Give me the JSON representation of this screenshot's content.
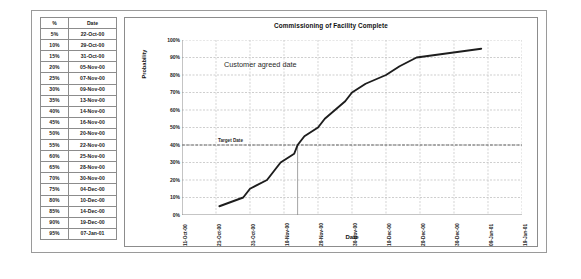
{
  "table": {
    "headers": [
      "%",
      "Date"
    ],
    "rows": [
      [
        "5%",
        "22-Oct-00"
      ],
      [
        "10%",
        "29-Oct-00"
      ],
      [
        "15%",
        "31-Oct-00"
      ],
      [
        "20%",
        "05-Nov-00"
      ],
      [
        "25%",
        "07-Nov-00"
      ],
      [
        "30%",
        "09-Nov-00"
      ],
      [
        "35%",
        "13-Nov-00"
      ],
      [
        "40%",
        "14-Nov-00"
      ],
      [
        "45%",
        "16-Nov-00"
      ],
      [
        "50%",
        "20-Nov-00"
      ],
      [
        "55%",
        "22-Nov-00"
      ],
      [
        "60%",
        "25-Nov-00"
      ],
      [
        "65%",
        "28-Nov-00"
      ],
      [
        "70%",
        "30-Nov-00"
      ],
      [
        "75%",
        "04-Dec-00"
      ],
      [
        "80%",
        "10-Dec-00"
      ],
      [
        "85%",
        "14-Dec-00"
      ],
      [
        "90%",
        "19-Dec-00"
      ],
      [
        "95%",
        "07-Jan-01"
      ]
    ]
  },
  "chart_data": {
    "type": "line",
    "title": "Commissioning of Facility Complete",
    "xlabel": "Date",
    "ylabel": "Probability",
    "ylim": [
      0,
      100
    ],
    "ytick_labels": [
      "0%",
      "10%",
      "20%",
      "30%",
      "40%",
      "50%",
      "60%",
      "70%",
      "80%",
      "90%",
      "100%"
    ],
    "ytick_values": [
      0,
      10,
      20,
      30,
      40,
      50,
      60,
      70,
      80,
      90,
      100
    ],
    "xtick_labels": [
      "11-Oct-00",
      "21-Oct-00",
      "31-Oct-00",
      "10-Nov-00",
      "20-Nov-00",
      "30-Nov-00",
      "10-Dec-00",
      "20-Dec-00",
      "30-Dec-00",
      "09-Jan-01",
      "19-Jan-01"
    ],
    "grid": true,
    "legend": "none",
    "series": [
      {
        "name": "Cumulative probability",
        "x": [
          "22-Oct-00",
          "29-Oct-00",
          "31-Oct-00",
          "05-Nov-00",
          "07-Nov-00",
          "09-Nov-00",
          "13-Nov-00",
          "14-Nov-00",
          "16-Nov-00",
          "20-Nov-00",
          "22-Nov-00",
          "25-Nov-00",
          "28-Nov-00",
          "30-Nov-00",
          "04-Dec-00",
          "10-Dec-00",
          "14-Dec-00",
          "19-Dec-00",
          "07-Jan-01"
        ],
        "values": [
          5,
          10,
          15,
          20,
          25,
          30,
          35,
          40,
          45,
          50,
          55,
          60,
          65,
          70,
          75,
          80,
          85,
          90,
          95
        ]
      }
    ],
    "annotations": [
      {
        "text": "Customer agreed date",
        "at_y": 85
      },
      {
        "text": "Target Date",
        "at_y": 40
      }
    ],
    "reference_lines": [
      {
        "name": "target-date-horizontal",
        "orientation": "horizontal",
        "value": 40
      },
      {
        "name": "target-date-vertical",
        "orientation": "vertical",
        "value": "14-Nov-00"
      }
    ]
  }
}
